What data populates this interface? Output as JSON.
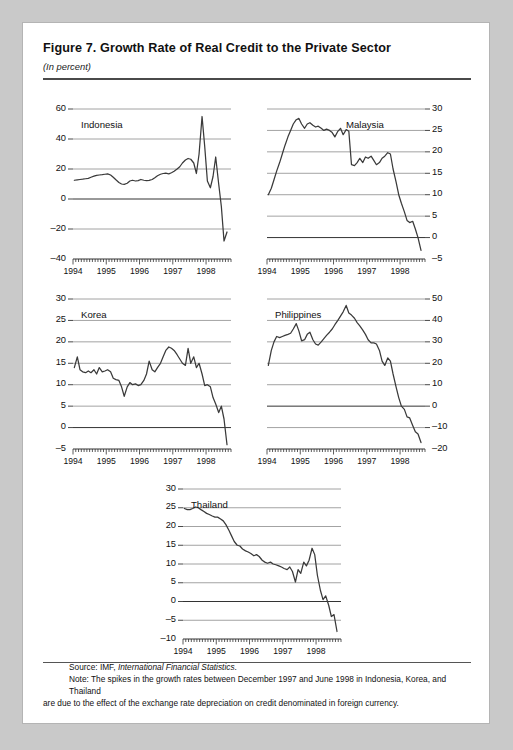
{
  "figure": {
    "title": "Figure 7.  Growth Rate of Real Credit to the Private Sector",
    "subtitle": "(In percent)",
    "source_prefix": "Source:  IMF, ",
    "source_italic": "International Financial Statistics",
    "source_suffix": ".",
    "note_line1": "Note:  The spikes in the growth rates between December 1997 and June 1998 in Indonesia, Korea, and Thailand",
    "note_line2": "are due to the effect of the exchange rate depreciation on credit denominated in foreign currency."
  },
  "style": {
    "page_background": "#c9c9c9",
    "card_background": "#ffffff",
    "line_color": "#3a3a3a",
    "grid_color": "#8c8c8c",
    "axis_color": "#333333",
    "text_color": "#111111"
  },
  "chart_data": [
    {
      "id": "indonesia",
      "type": "line",
      "title": "Indonesia",
      "xlabel": "",
      "ylabel": "",
      "grid": true,
      "legend": "none",
      "y_axis_side": "left",
      "ylim": [
        -40,
        60
      ],
      "yticks": [
        -40,
        -20,
        0,
        20,
        40,
        60
      ],
      "ytick_labels": [
        "–40",
        "–20",
        "0",
        "20",
        "40",
        "60"
      ],
      "xlim": [
        1994.0,
        1998.75
      ],
      "xticks": [
        1994,
        1995,
        1996,
        1997,
        1998
      ],
      "xtick_labels": [
        "1994",
        "1995",
        "1996",
        "1997",
        "1998"
      ],
      "x": [
        1994.04,
        1994.13,
        1994.21,
        1994.29,
        1994.38,
        1994.46,
        1994.54,
        1994.63,
        1994.71,
        1994.79,
        1994.88,
        1994.96,
        1995.04,
        1995.13,
        1995.21,
        1995.29,
        1995.38,
        1995.46,
        1995.54,
        1995.63,
        1995.71,
        1995.79,
        1995.88,
        1995.96,
        1996.04,
        1996.13,
        1996.21,
        1996.29,
        1996.38,
        1996.46,
        1996.54,
        1996.63,
        1996.71,
        1996.79,
        1996.88,
        1996.96,
        1997.04,
        1997.13,
        1997.21,
        1997.29,
        1997.38,
        1997.46,
        1997.54,
        1997.63,
        1997.71,
        1997.79,
        1997.88,
        1997.96,
        1998.04,
        1998.13,
        1998.21,
        1998.29,
        1998.38,
        1998.46,
        1998.54,
        1998.63
      ],
      "values": [
        12.5,
        12.8,
        13.0,
        13.2,
        13.5,
        13.8,
        14.5,
        15.2,
        15.8,
        16.0,
        16.2,
        16.5,
        16.8,
        16.0,
        14.5,
        12.8,
        11.0,
        10.0,
        9.8,
        10.5,
        12.0,
        12.5,
        12.0,
        12.3,
        13.0,
        12.5,
        12.2,
        12.4,
        13.0,
        14.2,
        15.5,
        16.5,
        17.0,
        17.2,
        16.8,
        17.5,
        18.5,
        20.0,
        21.5,
        24.0,
        26.0,
        27.0,
        26.5,
        24.0,
        17.0,
        30.0,
        55.0,
        35.0,
        12.0,
        7.5,
        15.0,
        28.0,
        10.0,
        -5.0,
        -28.0,
        -22.0
      ]
    },
    {
      "id": "malaysia",
      "type": "line",
      "title": "Malaysia",
      "xlabel": "",
      "ylabel": "",
      "grid": true,
      "legend": "none",
      "y_axis_side": "right",
      "ylim": [
        -5,
        30
      ],
      "yticks": [
        -5,
        0,
        5,
        10,
        15,
        20,
        25,
        30
      ],
      "ytick_labels": [
        "–5",
        "0",
        "5",
        "10",
        "15",
        "20",
        "25",
        "30"
      ],
      "xlim": [
        1994.0,
        1998.75
      ],
      "xticks": [
        1994,
        1995,
        1996,
        1997,
        1998
      ],
      "xtick_labels": [
        "1994",
        "1995",
        "1996",
        "1997",
        "1998"
      ],
      "x": [
        1994.04,
        1994.13,
        1994.21,
        1994.29,
        1994.38,
        1994.46,
        1994.54,
        1994.63,
        1994.71,
        1994.79,
        1994.88,
        1994.96,
        1995.04,
        1995.13,
        1995.21,
        1995.29,
        1995.38,
        1995.46,
        1995.54,
        1995.63,
        1995.71,
        1995.79,
        1995.88,
        1995.96,
        1996.04,
        1996.13,
        1996.21,
        1996.29,
        1996.38,
        1996.46,
        1996.54,
        1996.63,
        1996.71,
        1996.79,
        1996.88,
        1996.96,
        1997.04,
        1997.13,
        1997.21,
        1997.29,
        1997.38,
        1997.46,
        1997.54,
        1997.63,
        1997.71,
        1997.79,
        1997.88,
        1997.96,
        1998.04,
        1998.13,
        1998.21,
        1998.29,
        1998.38,
        1998.46,
        1998.54,
        1998.63
      ],
      "values": [
        10.0,
        11.5,
        13.5,
        15.5,
        17.5,
        19.5,
        21.5,
        23.5,
        25.0,
        26.5,
        27.5,
        27.8,
        26.5,
        25.5,
        26.5,
        26.8,
        26.2,
        25.8,
        26.0,
        25.5,
        25.0,
        25.3,
        25.0,
        24.5,
        23.5,
        24.8,
        25.5,
        24.0,
        25.2,
        24.8,
        17.0,
        16.8,
        17.5,
        18.5,
        17.5,
        18.8,
        18.5,
        19.0,
        18.0,
        17.0,
        17.5,
        18.5,
        19.0,
        19.8,
        19.5,
        16.0,
        13.0,
        10.0,
        8.0,
        6.0,
        4.0,
        3.5,
        3.8,
        2.0,
        0.0,
        -3.0
      ]
    },
    {
      "id": "korea",
      "type": "line",
      "title": "Korea",
      "xlabel": "",
      "ylabel": "",
      "grid": true,
      "legend": "none",
      "y_axis_side": "left",
      "ylim": [
        -5,
        30
      ],
      "yticks": [
        -5,
        0,
        5,
        10,
        15,
        20,
        25,
        30
      ],
      "ytick_labels": [
        "–5",
        "0",
        "5",
        "10",
        "15",
        "20",
        "25",
        "30"
      ],
      "xlim": [
        1994.0,
        1998.75
      ],
      "xticks": [
        1994,
        1995,
        1996,
        1997,
        1998
      ],
      "xtick_labels": [
        "1994",
        "1995",
        "1996",
        "1997",
        "1998"
      ],
      "x": [
        1994.04,
        1994.13,
        1994.21,
        1994.29,
        1994.38,
        1994.46,
        1994.54,
        1994.63,
        1994.71,
        1994.79,
        1994.88,
        1994.96,
        1995.04,
        1995.13,
        1995.21,
        1995.29,
        1995.38,
        1995.46,
        1995.54,
        1995.63,
        1995.71,
        1995.79,
        1995.88,
        1995.96,
        1996.04,
        1996.13,
        1996.21,
        1996.29,
        1996.38,
        1996.46,
        1996.54,
        1996.63,
        1996.71,
        1996.79,
        1996.88,
        1996.96,
        1997.04,
        1997.13,
        1997.21,
        1997.29,
        1997.38,
        1997.46,
        1997.54,
        1997.63,
        1997.71,
        1997.79,
        1997.88,
        1997.96,
        1998.04,
        1998.13,
        1998.21,
        1998.29,
        1998.38,
        1998.46,
        1998.54,
        1998.63
      ],
      "values": [
        14.0,
        16.5,
        13.5,
        13.0,
        12.8,
        13.2,
        12.8,
        13.5,
        12.5,
        14.0,
        13.0,
        13.2,
        13.5,
        13.0,
        11.5,
        11.2,
        11.0,
        9.5,
        7.3,
        9.5,
        10.5,
        10.0,
        10.2,
        9.8,
        10.0,
        11.0,
        12.5,
        15.5,
        13.5,
        13.0,
        14.0,
        15.0,
        16.5,
        18.0,
        18.8,
        18.5,
        18.0,
        17.0,
        16.0,
        15.0,
        14.5,
        18.5,
        15.0,
        16.5,
        14.0,
        15.0,
        12.5,
        9.8,
        10.0,
        9.5,
        7.0,
        5.5,
        3.5,
        5.0,
        2.0,
        -4.0
      ]
    },
    {
      "id": "philippines",
      "type": "line",
      "title": "Philippines",
      "xlabel": "",
      "ylabel": "",
      "grid": true,
      "legend": "none",
      "y_axis_side": "right",
      "ylim": [
        -20,
        50
      ],
      "yticks": [
        -20,
        -10,
        0,
        10,
        20,
        30,
        40,
        50
      ],
      "ytick_labels": [
        "–20",
        "–10",
        "0",
        "10",
        "20",
        "30",
        "40",
        "50"
      ],
      "xlim": [
        1994.0,
        1998.75
      ],
      "xticks": [
        1994,
        1995,
        1996,
        1997,
        1998
      ],
      "xtick_labels": [
        "1994",
        "1995",
        "1996",
        "1997",
        "1998"
      ],
      "x": [
        1994.04,
        1994.13,
        1994.21,
        1994.29,
        1994.38,
        1994.46,
        1994.54,
        1994.63,
        1994.71,
        1994.79,
        1994.88,
        1994.96,
        1995.04,
        1995.13,
        1995.21,
        1995.29,
        1995.38,
        1995.46,
        1995.54,
        1995.63,
        1995.71,
        1995.79,
        1995.88,
        1995.96,
        1996.04,
        1996.13,
        1996.21,
        1996.29,
        1996.38,
        1996.46,
        1996.54,
        1996.63,
        1996.71,
        1996.79,
        1996.88,
        1996.96,
        1997.04,
        1997.13,
        1997.21,
        1997.29,
        1997.38,
        1997.46,
        1997.54,
        1997.63,
        1997.71,
        1997.79,
        1997.88,
        1997.96,
        1998.04,
        1998.13,
        1998.21,
        1998.29,
        1998.38,
        1998.46,
        1998.54,
        1998.63
      ],
      "values": [
        19.0,
        26.0,
        30.0,
        32.5,
        32.0,
        32.5,
        33.0,
        33.5,
        34.0,
        36.0,
        38.5,
        35.0,
        30.5,
        31.0,
        33.5,
        34.5,
        31.0,
        29.0,
        28.5,
        30.0,
        31.5,
        33.0,
        34.5,
        36.0,
        38.0,
        40.0,
        42.0,
        44.0,
        47.0,
        43.5,
        42.5,
        41.0,
        39.0,
        37.5,
        35.5,
        33.5,
        31.0,
        29.5,
        29.5,
        29.0,
        26.0,
        21.0,
        19.0,
        22.5,
        21.0,
        15.0,
        9.0,
        4.0,
        0.0,
        -1.5,
        -5.0,
        -5.5,
        -9.0,
        -12.0,
        -13.0,
        -17.0
      ]
    },
    {
      "id": "thailand",
      "type": "line",
      "title": "Thailand",
      "xlabel": "",
      "ylabel": "",
      "grid": true,
      "legend": "none",
      "y_axis_side": "left",
      "ylim": [
        -10,
        30
      ],
      "yticks": [
        -10,
        -5,
        0,
        5,
        10,
        15,
        20,
        25,
        30
      ],
      "ytick_labels": [
        "–10",
        "–5",
        "0",
        "5",
        "10",
        "15",
        "20",
        "25",
        "30"
      ],
      "xlim": [
        1994.0,
        1998.75
      ],
      "xticks": [
        1994,
        1995,
        1996,
        1997,
        1998
      ],
      "xtick_labels": [
        "1994",
        "1995",
        "1996",
        "1997",
        "1998"
      ],
      "x": [
        1994.04,
        1994.13,
        1994.21,
        1994.29,
        1994.38,
        1994.46,
        1994.54,
        1994.63,
        1994.71,
        1994.79,
        1994.88,
        1994.96,
        1995.04,
        1995.13,
        1995.21,
        1995.29,
        1995.38,
        1995.46,
        1995.54,
        1995.63,
        1995.71,
        1995.79,
        1995.88,
        1995.96,
        1996.04,
        1996.13,
        1996.21,
        1996.29,
        1996.38,
        1996.46,
        1996.54,
        1996.63,
        1996.71,
        1996.79,
        1996.88,
        1996.96,
        1997.04,
        1997.13,
        1997.21,
        1997.29,
        1997.38,
        1997.46,
        1997.54,
        1997.63,
        1997.71,
        1997.79,
        1997.88,
        1997.96,
        1998.04,
        1998.13,
        1998.21,
        1998.29,
        1998.38,
        1998.46,
        1998.54,
        1998.63
      ],
      "values": [
        24.8,
        24.5,
        24.5,
        24.8,
        25.2,
        25.0,
        24.5,
        24.0,
        23.5,
        23.2,
        22.8,
        22.5,
        22.5,
        22.0,
        21.5,
        20.5,
        19.0,
        17.5,
        16.0,
        15.0,
        14.8,
        14.0,
        13.5,
        13.2,
        12.8,
        12.2,
        12.5,
        12.0,
        11.0,
        10.5,
        10.2,
        10.5,
        10.0,
        9.8,
        9.5,
        9.2,
        8.8,
        8.5,
        9.2,
        8.0,
        5.2,
        8.5,
        7.5,
        10.5,
        9.5,
        11.0,
        14.2,
        12.5,
        7.0,
        3.0,
        0.5,
        1.5,
        -1.0,
        -4.0,
        -3.5,
        -8.0
      ]
    }
  ]
}
